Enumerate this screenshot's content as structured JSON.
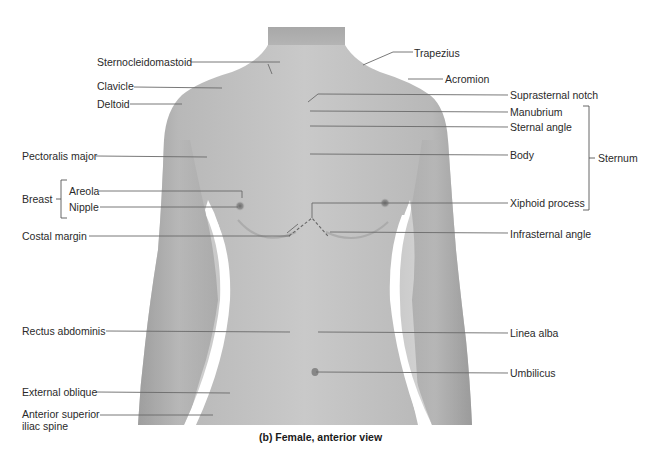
{
  "figure": {
    "caption": "(b) Female, anterior view",
    "colors": {
      "background": "#ffffff",
      "skin_light": "#c8c8c8",
      "skin_mid": "#b4b4b4",
      "skin_dark": "#9a9a9a",
      "leader_line": "#6a6a6a",
      "text": "#2a2a2a"
    }
  },
  "labels_left": {
    "sternocleidomastoid": "Sternocleidomastoid",
    "clavicle": "Clavicle",
    "deltoid": "Deltoid",
    "pectoralis_major": "Pectoralis major",
    "breast": "Breast",
    "areola": "Areola",
    "nipple": "Nipple",
    "costal_margin": "Costal margin",
    "rectus_abdominis": "Rectus abdominis",
    "external_oblique": "External oblique",
    "asis_line1": "Anterior superior",
    "asis_line2": "iliac spine"
  },
  "labels_right": {
    "trapezius": "Trapezius",
    "acromion": "Acromion",
    "suprasternal_notch": "Suprasternal notch",
    "manubrium": "Manubrium",
    "sternal_angle": "Sternal angle",
    "body": "Body",
    "sternum": "Sternum",
    "xiphoid_process": "Xiphoid process",
    "infrasternal_angle": "Infrasternal angle",
    "linea_alba": "Linea alba",
    "umbilicus": "Umbilicus"
  }
}
